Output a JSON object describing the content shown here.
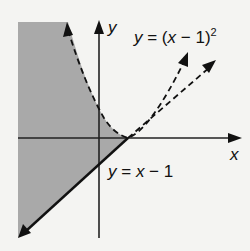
{
  "diagram": {
    "axes": {
      "x_label": "x",
      "y_label": "y"
    },
    "curves": [
      {
        "name": "parabola",
        "equation": "y = (x − 1)²",
        "style": "dashed"
      },
      {
        "name": "line",
        "equation": "y = x − 1",
        "style": "solid then dashed"
      }
    ],
    "labels": {
      "parabola_eq_lhs": "y",
      "parabola_eq_mid": " = (",
      "parabola_eq_x": "x",
      "parabola_eq_rest": " − 1)",
      "parabola_eq_exp": "2",
      "line_eq_lhs": "y",
      "line_eq_mid": " = ",
      "line_eq_x": "x",
      "line_eq_rest": " − 1"
    },
    "shading": {
      "color": "#a9a9a9",
      "description": "region between line and parabola, left of intersection"
    },
    "colors": {
      "background": "#f4f4f2",
      "ink": "#111111",
      "shade": "#a9a9a9"
    }
  }
}
